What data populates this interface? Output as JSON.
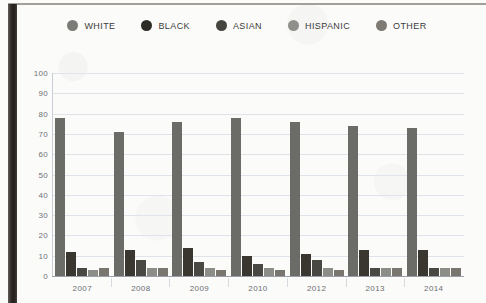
{
  "chart_data": {
    "type": "bar",
    "title": "",
    "xlabel": "",
    "ylabel": "",
    "ylim": [
      0,
      100
    ],
    "ytick_values": [
      100,
      90,
      80,
      70,
      60,
      50,
      40,
      30,
      20,
      10,
      0
    ],
    "ytick_labels": [
      "100",
      "90",
      "80",
      "70",
      "60",
      "50",
      "40",
      "30",
      "20",
      "10",
      "0"
    ],
    "grid": true,
    "legend_position": "top-center",
    "categories": [
      "2007",
      "2008",
      "2009",
      "2010",
      "2012",
      "2013",
      "2014"
    ],
    "series": [
      {
        "name": "WHITE",
        "color": "#6b6b68",
        "values": [
          78,
          71,
          76,
          78,
          76,
          74,
          73
        ]
      },
      {
        "name": "BLACK",
        "color": "#39372f",
        "values": [
          12,
          13,
          14,
          10,
          11,
          13,
          13
        ]
      },
      {
        "name": "ASIAN",
        "color": "#4a4843",
        "values": [
          4,
          8,
          7,
          6,
          8,
          4,
          4
        ]
      },
      {
        "name": "HISPANIC",
        "color": "#8c8c88",
        "values": [
          3,
          4,
          4,
          4,
          4,
          4,
          4
        ]
      },
      {
        "name": "OTHER",
        "color": "#78766f",
        "values": [
          4,
          4,
          3,
          3,
          3,
          4,
          4
        ]
      }
    ]
  },
  "legend": {
    "items": [
      {
        "label": "WHITE",
        "color": "#7b7b77",
        "icon": "legend-dot-icon"
      },
      {
        "label": "BLACK",
        "color": "#2e2c26",
        "icon": "legend-dot-icon"
      },
      {
        "label": "ASIAN",
        "color": "#46443e",
        "icon": "legend-dot-icon"
      },
      {
        "label": "HISPANIC",
        "color": "#8f8f8b",
        "icon": "legend-dot-icon"
      },
      {
        "label": "OTHER",
        "color": "#7d7b74",
        "icon": "legend-dot-icon"
      }
    ]
  }
}
